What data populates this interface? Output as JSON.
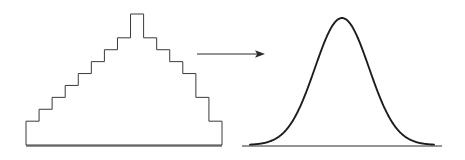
{
  "figure": {
    "caption": "",
    "background_color": "#ffffff",
    "line_color": "#2b2b2b",
    "curve_color": "#1d1d1d",
    "width": 465,
    "height": 160
  },
  "panels": {
    "left": {
      "name": "histogram-panel",
      "label": "",
      "baseline_y": 145,
      "baseline_x_start": 26,
      "baseline_x_end": 222
    },
    "right": {
      "name": "normal-curve-panel",
      "label": "",
      "baseline_y": 145,
      "baseline_x_start": 242,
      "baseline_x_end": 442
    }
  },
  "arrow": {
    "name": "transition-arrow",
    "label": "",
    "direction": "right",
    "x_start": 197,
    "x_end": 265,
    "y": 54
  },
  "chart_data": [
    {
      "type": "bar",
      "name": "discrete-histogram",
      "title": "",
      "subtitle": "",
      "xlabel": "",
      "ylabel": "",
      "grid": false,
      "legend": null,
      "axis_visible": [
        "x"
      ],
      "ylim": [
        0,
        15
      ],
      "xlim": [
        0,
        15
      ],
      "categories": [
        "1",
        "2",
        "3",
        "4",
        "5",
        "6",
        "7",
        "8",
        "9",
        "10",
        "11",
        "12",
        "13",
        "14",
        "15"
      ],
      "values": [
        2,
        3,
        4,
        5,
        6,
        7,
        8,
        9,
        11,
        9,
        8,
        7,
        6,
        4,
        2
      ],
      "bar_width_px": 13,
      "bar_count": 15,
      "peak_category": "9",
      "peak_value": 11,
      "outline_only": true
    },
    {
      "type": "line",
      "name": "normal-density-curve",
      "title": "",
      "subtitle": "",
      "xlabel": "",
      "ylabel": "",
      "grid": false,
      "legend": null,
      "axis_visible": [
        "x"
      ],
      "distribution": "normal",
      "mean": 0,
      "sd": 1,
      "xlim": [
        -3.4,
        3.4
      ],
      "ylim": [
        0,
        1
      ],
      "x": [
        -3.4,
        -3.0,
        -2.6,
        -2.2,
        -1.8,
        -1.4,
        -1.0,
        -0.6,
        -0.2,
        0.2,
        0.6,
        1.0,
        1.4,
        1.8,
        2.2,
        2.6,
        3.0,
        3.4
      ],
      "y": [
        0.003,
        0.011,
        0.034,
        0.089,
        0.198,
        0.375,
        0.607,
        0.835,
        0.98,
        0.98,
        0.835,
        0.607,
        0.375,
        0.198,
        0.089,
        0.034,
        0.011,
        0.003
      ],
      "peak_x": 0,
      "peak_y": 1.0,
      "smooth": true
    }
  ]
}
